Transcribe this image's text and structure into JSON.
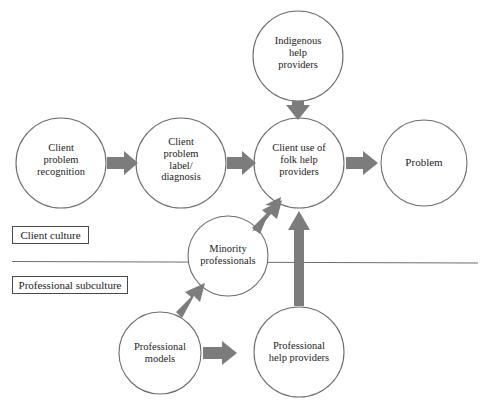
{
  "diagram": {
    "colors": {
      "circle_stroke": "#6d6d6d",
      "arrow_fill": "#7c7c7c",
      "divider_line": "#6d6d6d",
      "zone_box_border": "#4a4a4a",
      "text": "#1b1b1b",
      "background": "#ffffff"
    },
    "nodes": [
      {
        "id": "indigenous-help-providers",
        "label": "Indigenous\nhelp\nproviders",
        "cx": 298,
        "cy": 56,
        "r": 45,
        "zone": "client-culture"
      },
      {
        "id": "client-problem-recognition",
        "label": "Client\nproblem\nrecognition",
        "cx": 61,
        "cy": 163,
        "r": 45,
        "zone": "client-culture"
      },
      {
        "id": "client-problem-label-diagnosis",
        "label": "Client\nproblem\nlabel/\ndiagnosis",
        "cx": 181,
        "cy": 163,
        "r": 45,
        "zone": "client-culture"
      },
      {
        "id": "client-use-of-folk-help-providers",
        "label": "Client use of\nfolk help\nproviders",
        "cx": 299,
        "cy": 163,
        "r": 45,
        "zone": "client-culture"
      },
      {
        "id": "problem",
        "label": "Problem",
        "cx": 424,
        "cy": 163,
        "r": 43,
        "zone": "client-culture"
      },
      {
        "id": "minority-professionals",
        "label": "Minority\nprofessionals",
        "cx": 228,
        "cy": 256,
        "r": 40,
        "zone": "boundary"
      },
      {
        "id": "professional-models",
        "label": "Professional\nmodels",
        "cx": 160,
        "cy": 353,
        "r": 41,
        "zone": "professional-subculture"
      },
      {
        "id": "professional-help-providers",
        "label": "Professional\nhelp providers",
        "cx": 299,
        "cy": 352,
        "r": 45,
        "zone": "professional-subculture"
      }
    ],
    "arrows": [
      {
        "id": "arrow-recognition-to-label",
        "from": "client-problem-recognition",
        "to": "client-problem-label-diagnosis",
        "direction": "right"
      },
      {
        "id": "arrow-label-to-folk-use",
        "from": "client-problem-label-diagnosis",
        "to": "client-use-of-folk-help-providers",
        "direction": "right"
      },
      {
        "id": "arrow-folk-use-to-problem",
        "from": "client-use-of-folk-help-providers",
        "to": "problem",
        "direction": "right"
      },
      {
        "id": "arrow-indigenous-to-folk-use",
        "from": "indigenous-help-providers",
        "to": "client-use-of-folk-help-providers",
        "direction": "down"
      },
      {
        "id": "arrow-minority-to-folk-use",
        "from": "minority-professionals",
        "to": "client-use-of-folk-help-providers",
        "direction": "up-right"
      },
      {
        "id": "arrow-models-to-minority",
        "from": "professional-models",
        "to": "minority-professionals",
        "direction": "up-right"
      },
      {
        "id": "arrow-models-to-prof-help",
        "from": "professional-models",
        "to": "professional-help-providers",
        "direction": "right"
      },
      {
        "id": "arrow-prof-help-to-folk-use",
        "from": "professional-help-providers",
        "to": "client-use-of-folk-help-providers",
        "direction": "up"
      }
    ],
    "divider": {
      "id": "culture-divider-line",
      "x1": 12,
      "y1": 261,
      "x2": 478,
      "y2": 263
    },
    "zone_labels": [
      {
        "id": "client-culture-label",
        "text": "Client culture",
        "x": 12,
        "y": 226,
        "w": 77,
        "h": 18
      },
      {
        "id": "professional-subculture-label",
        "text": "Professional subculture",
        "x": 12,
        "y": 276,
        "w": 116,
        "h": 18
      }
    ]
  }
}
